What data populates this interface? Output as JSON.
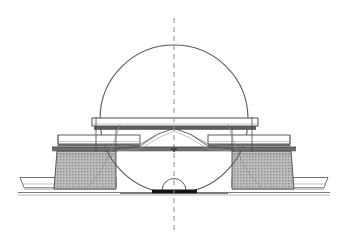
{
  "drawing": {
    "title": "Axisymmetric cross-section half-view",
    "type": "technical-line-drawing",
    "canvas": {
      "width": 348,
      "height": 249,
      "background": "#ffffff"
    },
    "colors": {
      "outline": "#3b3b3b",
      "thin_line": "#6e6e6e",
      "circle_stroke": "#5a5a5a",
      "hatch_fill": "#b8b8b8",
      "hatch_line": "#8c8c8c",
      "slab_fill": "#ffffff",
      "slab_edge": "#4a4a4a",
      "dark_band": "#555555",
      "darkest_plate": "#1a1a1a",
      "centerline": "#8a8a8a",
      "ground_line": "#7a7a7a"
    },
    "centerline": {
      "label": "vertical axis of symmetry",
      "x": 174,
      "y_top": 18,
      "y_bottom": 231,
      "dash": "5 4",
      "width": 1
    },
    "circle": {
      "label": "enveloping construction circle",
      "cx": 174,
      "cy": 119,
      "r": 74,
      "stroke_width": 1.1
    },
    "center_mark": {
      "label": "center point tick",
      "x": 174,
      "y": 149
    },
    "top_slab": {
      "label": "upper deck slab",
      "x": 92,
      "y": 118,
      "width": 166,
      "height": 8
    },
    "mid_slabs": [
      {
        "label": "left intermediate slab",
        "x": 58,
        "y": 135,
        "width": 82,
        "height": 9
      },
      {
        "label": "right intermediate slab",
        "x": 208,
        "y": 135,
        "width": 82,
        "height": 9
      }
    ],
    "mid_band": {
      "label": "intermediate continuous band",
      "x": 52,
      "y": 147,
      "width": 244,
      "height": 4
    },
    "columns": [
      {
        "label": "left hatched column",
        "x_top_left": 57,
        "x_top_right": 116,
        "x_bot_left": 54,
        "x_bot_right": 116,
        "y_top": 151,
        "y_bottom": 189
      },
      {
        "label": "right hatched column",
        "x_top_left": 232,
        "x_top_right": 291,
        "x_bot_left": 232,
        "x_bot_right": 294,
        "y_top": 151,
        "y_bottom": 189
      }
    ],
    "base_slabs": [
      {
        "label": "left footing slab",
        "x": 20,
        "y": 177,
        "width": 100,
        "height": 10
      },
      {
        "label": "right footing slab",
        "x": 228,
        "y": 177,
        "width": 100,
        "height": 10
      }
    ],
    "ground": {
      "label": "ground / base reference line",
      "x_start": 18,
      "x_end": 330,
      "y": 192
    },
    "center_dome": {
      "label": "central hemispherical boss",
      "cx": 174,
      "cy": 190,
      "r": 12
    },
    "center_plate": {
      "label": "central dark bearing plate",
      "x": 152,
      "y": 189,
      "width": 45,
      "height": 4
    },
    "taper": {
      "label": "central conical taper to apex",
      "apex_x": 174,
      "apex_y": 128,
      "left_x": 116,
      "right_x": 232,
      "base_y": 148
    },
    "verticals": [
      {
        "label": "left hanger line",
        "x": 96,
        "y_top": 118,
        "y_bottom": 152
      },
      {
        "label": "right hanger line",
        "x": 252,
        "y_top": 118,
        "y_bottom": 152
      },
      {
        "label": "left inner tie line",
        "x": 116,
        "y_top": 126,
        "y_bottom": 152
      },
      {
        "label": "right inner tie line",
        "x": 232,
        "y_top": 126,
        "y_bottom": 152
      }
    ]
  }
}
